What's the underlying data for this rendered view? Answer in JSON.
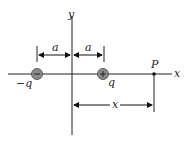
{
  "diagram": {
    "type": "electric-dipole-on-x-axis",
    "axes": {
      "x_label": "x",
      "y_label": "y"
    },
    "charges": [
      {
        "label": "−q",
        "sign": "−",
        "color": "#8a8a8a"
      },
      {
        "label": "q",
        "sign": "+",
        "color": "#8a8a8a"
      }
    ],
    "point": {
      "label": "P"
    },
    "dimensions": {
      "left_a": "a",
      "right_a": "a",
      "distance_x": "x"
    }
  }
}
